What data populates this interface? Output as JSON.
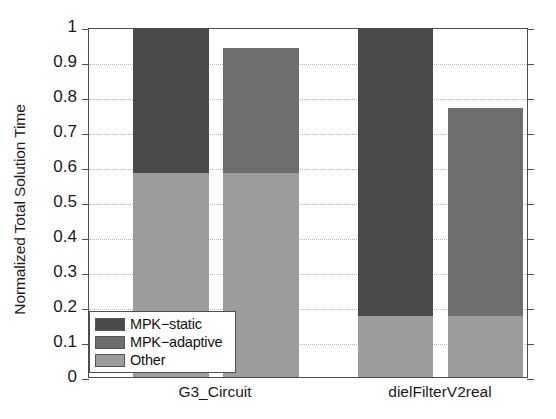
{
  "chart_data": {
    "type": "bar",
    "subtype": "grouped-stacked-bar",
    "title": "",
    "xlabel": "",
    "ylabel": "Normalized Total Solution Time",
    "ylim": [
      0,
      1
    ],
    "yticks": [
      "0",
      "0.1",
      "0.2",
      "0.3",
      "0.4",
      "0.5",
      "0.6",
      "0.7",
      "0.8",
      "0.9",
      "1"
    ],
    "ytick_values": [
      0,
      0.1,
      0.2,
      0.3,
      0.4,
      0.5,
      0.6,
      0.7,
      0.8,
      0.9,
      1.0
    ],
    "categories": [
      "G3_Circuit",
      "dielFilterV2real"
    ],
    "grid": "horizontal-dotted",
    "legend_position": "lower-left-inside",
    "legend_entries": [
      "MPK−static",
      "MPK−adaptive",
      "Other"
    ],
    "stack_order_bottom_to_top": [
      "Other",
      "variant"
    ],
    "series": [
      {
        "name": "MPK−static",
        "color": "#4a4a4a",
        "values": [
          0.41,
          0.82
        ],
        "totals": [
          1.0,
          1.0
        ]
      },
      {
        "name": "MPK−adaptive",
        "color": "#6e6e6e",
        "values": [
          0.355,
          0.595
        ],
        "totals": [
          0.945,
          0.775
        ]
      },
      {
        "name": "Other",
        "color": "#9c9c9c",
        "values": [
          0.59,
          0.18
        ],
        "note": "shared base segment under both bars of each group"
      }
    ],
    "bars": [
      {
        "group": "G3_Circuit",
        "variant": "MPK−static",
        "total": 1.0,
        "segments": [
          {
            "name": "Other",
            "from": 0,
            "to": 0.59,
            "color": "#9c9c9c"
          },
          {
            "name": "MPK−static",
            "from": 0.59,
            "to": 1.0,
            "color": "#4a4a4a"
          }
        ]
      },
      {
        "group": "G3_Circuit",
        "variant": "MPK−adaptive",
        "total": 0.945,
        "segments": [
          {
            "name": "Other",
            "from": 0,
            "to": 0.59,
            "color": "#9c9c9c"
          },
          {
            "name": "MPK−adaptive",
            "from": 0.59,
            "to": 0.945,
            "color": "#6e6e6e"
          }
        ]
      },
      {
        "group": "dielFilterV2real",
        "variant": "MPK−static",
        "total": 1.0,
        "segments": [
          {
            "name": "Other",
            "from": 0,
            "to": 0.18,
            "color": "#9c9c9c"
          },
          {
            "name": "MPK−static",
            "from": 0.18,
            "to": 1.0,
            "color": "#4a4a4a"
          }
        ]
      },
      {
        "group": "dielFilterV2real",
        "variant": "MPK−adaptive",
        "total": 0.775,
        "segments": [
          {
            "name": "Other",
            "from": 0,
            "to": 0.18,
            "color": "#9c9c9c"
          },
          {
            "name": "MPK−adaptive",
            "from": 0.18,
            "to": 0.775,
            "color": "#6e6e6e"
          }
        ]
      }
    ],
    "colors": {
      "mpk_static": "#4a4a4a",
      "mpk_adaptive": "#6e6e6e",
      "other": "#9c9c9c",
      "axis": "#4d4d4d",
      "grid": "#a9a9a9",
      "background": "#ffffff",
      "text": "#1a1a1a"
    }
  }
}
